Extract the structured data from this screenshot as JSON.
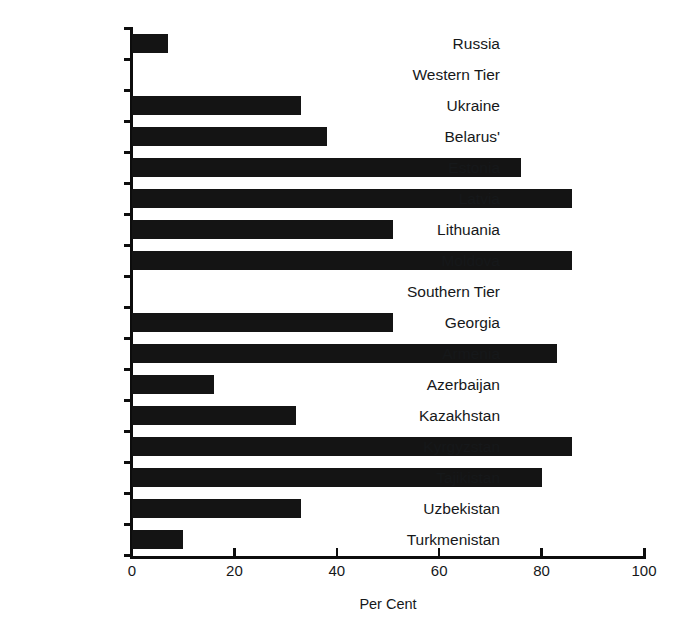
{
  "chart_data": {
    "type": "bar",
    "orientation": "horizontal",
    "title": "",
    "xlabel": "Per Cent",
    "ylabel": "",
    "xlim": [
      0,
      100
    ],
    "xticks": [
      0,
      20,
      40,
      60,
      80,
      100
    ],
    "grid": false,
    "legend": null,
    "categories": [
      "Russia",
      "Western Tier",
      "Ukraine",
      "Belarus'",
      "Estonia",
      "Latvia",
      "Lithuania",
      "Moldova",
      "Southern Tier",
      "Georgia",
      "Armenia",
      "Azerbaijan",
      "Kazakhstan",
      "Kyrgyzstan",
      "Tajikistan",
      "Uzbekistan",
      "Turkmenistan"
    ],
    "values": [
      7,
      0,
      33,
      38,
      76,
      86,
      51,
      86,
      0,
      51,
      83,
      16,
      32,
      86,
      80,
      33,
      10
    ],
    "group_headers": [
      "Western Tier",
      "Southern Tier"
    ],
    "bar_color": "#141414",
    "axis_color": "#0d0d0d",
    "background_color": "#ffffff"
  }
}
